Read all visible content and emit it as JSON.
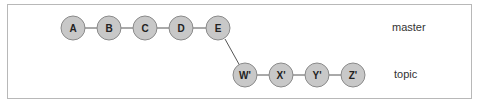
{
  "diagram": {
    "type": "git-rebase-commit-graph",
    "branches": [
      {
        "name": "master",
        "label": "master",
        "commits": [
          "A",
          "B",
          "C",
          "D",
          "E"
        ]
      },
      {
        "name": "topic",
        "label": "topic",
        "commits": [
          "W'",
          "X'",
          "Y'",
          "Z'"
        ],
        "base": "E"
      }
    ],
    "nodes": [
      {
        "id": "A",
        "label": "A",
        "cx": 73,
        "cy": 28
      },
      {
        "id": "B",
        "label": "B",
        "cx": 109,
        "cy": 28
      },
      {
        "id": "C",
        "label": "C",
        "cx": 145,
        "cy": 28
      },
      {
        "id": "D",
        "label": "D",
        "cx": 181,
        "cy": 28
      },
      {
        "id": "E",
        "label": "E",
        "cx": 218,
        "cy": 28
      },
      {
        "id": "W'",
        "label": "W'",
        "cx": 245,
        "cy": 75
      },
      {
        "id": "X'",
        "label": "X'",
        "cx": 281,
        "cy": 75
      },
      {
        "id": "Y'",
        "label": "Y'",
        "cx": 317,
        "cy": 75
      },
      {
        "id": "Z'",
        "label": "Z'",
        "cx": 353,
        "cy": 75
      }
    ],
    "colors": {
      "node_fill": "#c8c8c8",
      "node_stroke": "#8a8a8a",
      "edge": "#555555",
      "frame": "#b8b8b8"
    }
  }
}
